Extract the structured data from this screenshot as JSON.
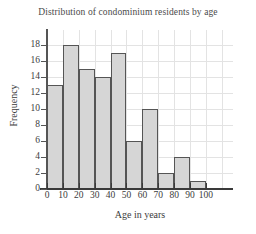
{
  "chart_data": {
    "type": "bar",
    "title": "Distribution of condominium residents by age",
    "xlabel": "Age in years",
    "ylabel": "Frequency",
    "categories": [
      "0-10",
      "10-20",
      "20-30",
      "30-40",
      "40-50",
      "50-60",
      "60-70",
      "70-80",
      "80-90",
      "90-100"
    ],
    "values": [
      13,
      18,
      15,
      14,
      17,
      6,
      10,
      2,
      4,
      1
    ],
    "x_tick_labels": [
      "0",
      "10",
      "20",
      "30",
      "40",
      "50",
      "60",
      "70",
      "80",
      "90",
      "100"
    ],
    "x_tick_values": [
      0,
      10,
      20,
      30,
      40,
      50,
      60,
      70,
      80,
      90,
      100
    ],
    "y_tick_labels": [
      "0",
      "2",
      "4",
      "6",
      "8",
      "10",
      "12",
      "14",
      "16",
      "18"
    ],
    "y_tick_values": [
      0,
      2,
      4,
      6,
      8,
      10,
      12,
      14,
      16,
      18
    ],
    "xlim": [
      0,
      117
    ],
    "ylim": [
      0,
      19.9
    ],
    "grid": true,
    "legend": false,
    "bin_width": 10,
    "bar_fill_color": "#d6d6d6",
    "bar_edge_color": "#555555",
    "gridline_color": "#e3e3e3",
    "axis_color": "#3a3a3a",
    "background_color": "#ffffff"
  }
}
